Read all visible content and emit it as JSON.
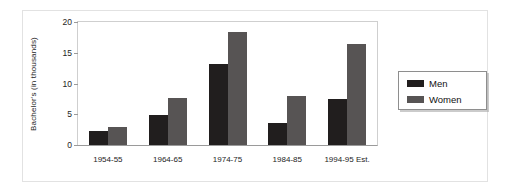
{
  "chart_data": {
    "type": "bar",
    "title": "",
    "subtitle": "",
    "xlabel": "",
    "ylabel": "Bachelor's (in thousands)",
    "ylim": [
      0,
      20
    ],
    "yticks": [
      0,
      5,
      10,
      15,
      20
    ],
    "ytick_labels": [
      "0",
      "5",
      "10",
      "15",
      "20"
    ],
    "grid": false,
    "legend_position": "right",
    "categories": [
      "1954-55",
      "1964-65",
      "1974-75",
      "1984-85",
      "1994-95 Est."
    ],
    "series": [
      {
        "name": "Men",
        "color": "#211e1e",
        "values": [
          2.2,
          4.9,
          13.2,
          3.5,
          7.5
        ]
      },
      {
        "name": "Women",
        "color": "#575454",
        "values": [
          3.0,
          7.6,
          18.4,
          8.0,
          16.4
        ]
      }
    ]
  },
  "legend": {
    "items": [
      {
        "label": "Men"
      },
      {
        "label": "Women"
      }
    ]
  },
  "colors": {
    "men": "#211e1e",
    "women": "#575454",
    "frame": "#e2e2e2",
    "axis": "#9a9a9a",
    "text": "#1d1d1d"
  }
}
